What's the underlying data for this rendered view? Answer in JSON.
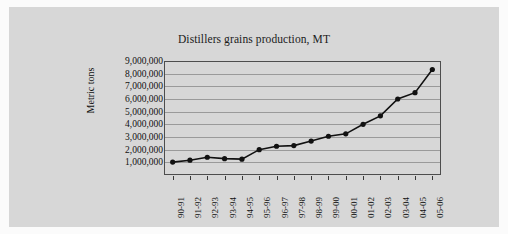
{
  "chart_data": {
    "type": "line",
    "title": "Distillers grains production, MT",
    "xlabel": "",
    "ylabel": "Metric tons",
    "categories": [
      "90-91",
      "91-92",
      "92-93",
      "93-94",
      "94-95",
      "95-96",
      "96-97",
      "97-98",
      "98-99",
      "99-00",
      "00-01",
      "01-02",
      "02-03",
      "03-04",
      "04-05",
      "05-06"
    ],
    "values": [
      1020000,
      1170000,
      1400000,
      1290000,
      1250000,
      2000000,
      2270000,
      2320000,
      2680000,
      3060000,
      3250000,
      4000000,
      4670000,
      6000000,
      6500000,
      8330000
    ],
    "series": [
      {
        "name": "Distillers grains production",
        "values": [
          1020000,
          1170000,
          1400000,
          1290000,
          1250000,
          2000000,
          2270000,
          2320000,
          2680000,
          3060000,
          3250000,
          4000000,
          4670000,
          6000000,
          6500000,
          8330000
        ]
      }
    ],
    "ylim": [
      0,
      9000000
    ],
    "ytick_labels": [
      "9,000,000",
      "8,000,000",
      "7,000,000",
      "6,000,000",
      "5,000,000",
      "4,000,000",
      "3,000,000",
      "2,000,000",
      "1,000,000"
    ],
    "ytick_values": [
      9000000,
      8000000,
      7000000,
      6000000,
      5000000,
      4000000,
      3000000,
      2000000,
      1000000
    ],
    "grid": true,
    "legend": null,
    "marker": "filled-circle",
    "line_color": "#111111",
    "marker_color": "#111111",
    "plot_bg_color": "#d7d7d7",
    "grid_color": "#9a9a9a",
    "axis_color": "#4d4d4d"
  }
}
